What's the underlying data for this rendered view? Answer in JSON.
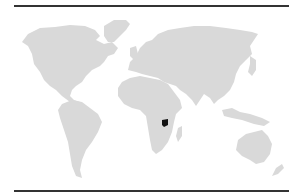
{
  "map": {
    "type": "world-locator-map",
    "highlighted_country": "Uganda",
    "colors": {
      "land": "#d9d9d9",
      "highlight": "#111111",
      "rule": "#333333",
      "background": "#ffffff"
    }
  }
}
